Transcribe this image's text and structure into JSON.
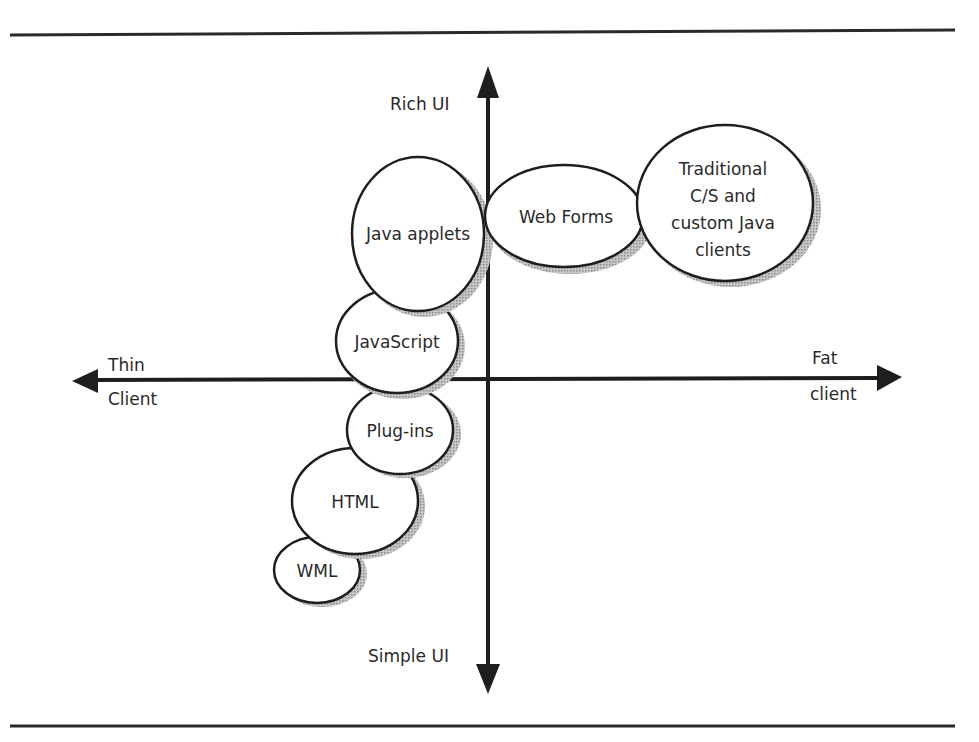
{
  "diagram": {
    "axes": {
      "y_top": "Rich UI",
      "y_bottom": "Simple UI",
      "x_left_line1": "Thin",
      "x_left_line2": "Client",
      "x_right_line1": "Fat",
      "x_right_line2": "client"
    },
    "bubbles": [
      {
        "id": "java-applets",
        "lines": [
          "Java applets"
        ]
      },
      {
        "id": "web-forms",
        "lines": [
          "Web Forms"
        ]
      },
      {
        "id": "traditional",
        "lines": [
          "Traditional",
          "C/S and",
          "custom Java",
          "clients"
        ]
      },
      {
        "id": "javascript",
        "lines": [
          "JavaScript"
        ]
      },
      {
        "id": "plug-ins",
        "lines": [
          "Plug-ins"
        ]
      },
      {
        "id": "html",
        "lines": [
          "HTML"
        ]
      },
      {
        "id": "wml",
        "lines": [
          "WML"
        ]
      }
    ],
    "colors": {
      "line": "#1e1e1e",
      "shadow": "#a8a8a8",
      "fill": "#ffffff"
    }
  }
}
